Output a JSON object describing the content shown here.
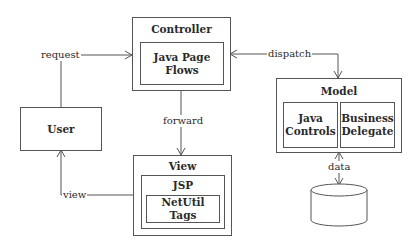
{
  "diagram": {
    "nodes": {
      "controller": {
        "title": "Controller",
        "inner": "Java Page\nFlows"
      },
      "user": {
        "label": "User"
      },
      "view": {
        "title": "View",
        "jsp": "JSP",
        "inner": "NetUtil Tags"
      },
      "model": {
        "title": "Model",
        "left": "Java\nControls",
        "right": "Business\nDelegate"
      },
      "datastore": {
        "shape": "cylinder"
      }
    },
    "edges": {
      "request": "request",
      "dispatch": "dispatch",
      "forward": "forward",
      "view": "view",
      "data": "data"
    },
    "colors": {
      "stroke": "#555555",
      "text": "#2a2a2a",
      "background": "#ffffff"
    }
  }
}
